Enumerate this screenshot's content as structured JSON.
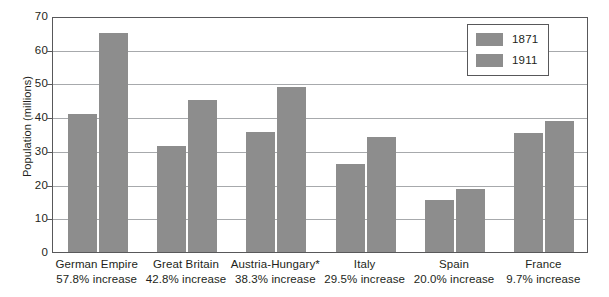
{
  "chart_data": {
    "type": "bar",
    "title": "",
    "xlabel": "",
    "ylabel": "Population (millions)",
    "ylim": [
      0,
      70
    ],
    "yticks": [
      0,
      10,
      20,
      30,
      40,
      50,
      60,
      70
    ],
    "ytick_labels": [
      "0",
      "10",
      "20",
      "30",
      "40",
      "50",
      "60",
      "70"
    ],
    "grid": true,
    "legend_position": "top-right",
    "bar_color": "#8d8d8d",
    "categories": [
      "German Empire",
      "Great Britain",
      "Austria-Hungary*",
      "Italy",
      "Spain",
      "France"
    ],
    "category_sublabels": [
      "57.8% increase",
      "42.8% increase",
      "38.3% increase",
      "29.5% increase",
      "20.0% increase",
      "9.7% increase"
    ],
    "series": [
      {
        "name": "1871",
        "values": [
          41.0,
          31.5,
          35.5,
          26.2,
          15.5,
          35.4
        ]
      },
      {
        "name": "1911",
        "values": [
          64.9,
          45.0,
          49.0,
          34.0,
          18.6,
          38.9
        ]
      }
    ]
  },
  "legend": {
    "entries": [
      {
        "label": "1871"
      },
      {
        "label": "1911"
      }
    ]
  },
  "axes": {
    "y_title": "Population (millions)"
  }
}
